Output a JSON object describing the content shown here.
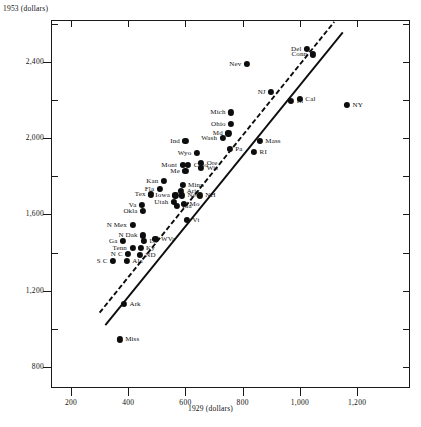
{
  "figure": {
    "faint_title": "",
    "ylabel": "1953 (dollars)",
    "xlabel": "1929 (dollars)"
  },
  "chart_data": {
    "type": "scatter",
    "title": "",
    "xlabel": "1929 (dollars)",
    "ylabel": "1953 (dollars)",
    "xlim": [
      130,
      1385
    ],
    "ylim": [
      690,
      2620
    ],
    "xticks": [
      200,
      400,
      600,
      800,
      1000,
      1200
    ],
    "xticklabels": [
      "200",
      "400",
      "600",
      "800",
      "1,000",
      "1,200"
    ],
    "yticks": [
      800,
      1200,
      1600,
      2000,
      2400
    ],
    "yticklabels": [
      "800",
      "1,200",
      "1,600",
      "2,000",
      "2,400"
    ],
    "minor_ticks": true,
    "grid": false,
    "legend": null,
    "points": [
      {
        "label": "Del",
        "x": 1025,
        "y": 2470,
        "lpos": "left"
      },
      {
        "label": "Conn",
        "x": 1045,
        "y": 2440,
        "lpos": "left"
      },
      {
        "label": "Nev",
        "x": 815,
        "y": 2390,
        "lpos": "left"
      },
      {
        "label": "NJ",
        "x": 900,
        "y": 2245,
        "lpos": "left"
      },
      {
        "label": "Ill",
        "x": 970,
        "y": 2195,
        "lpos": "right"
      },
      {
        "label": "Cal",
        "x": 1000,
        "y": 2205,
        "lpos": "right"
      },
      {
        "label": "NY",
        "x": 1165,
        "y": 2175,
        "lpos": "right"
      },
      {
        "label": "Mich",
        "x": 760,
        "y": 2135,
        "lpos": "left"
      },
      {
        "label": "Ohio",
        "x": 760,
        "y": 2075,
        "lpos": "left"
      },
      {
        "label": "Md",
        "x": 750,
        "y": 2025,
        "lpos": "left"
      },
      {
        "label": "Wash",
        "x": 730,
        "y": 2000,
        "lpos": "left"
      },
      {
        "label": "Ind",
        "x": 600,
        "y": 1985,
        "lpos": "left"
      },
      {
        "label": "Mass",
        "x": 860,
        "y": 1985,
        "lpos": "right"
      },
      {
        "label": "Pa",
        "x": 755,
        "y": 1945,
        "lpos": "right"
      },
      {
        "label": "RI",
        "x": 840,
        "y": 1930,
        "lpos": "right"
      },
      {
        "label": "Wyo",
        "x": 640,
        "y": 1925,
        "lpos": "left"
      },
      {
        "label": "Ore",
        "x": 655,
        "y": 1870,
        "lpos": "right"
      },
      {
        "label": "Colo",
        "x": 610,
        "y": 1860,
        "lpos": "right"
      },
      {
        "label": "Mont",
        "x": 590,
        "y": 1860,
        "lpos": "left"
      },
      {
        "label": "Wis",
        "x": 655,
        "y": 1845,
        "lpos": "right"
      },
      {
        "label": "Me",
        "x": 600,
        "y": 1830,
        "lpos": "left"
      },
      {
        "label": "Kan",
        "x": 525,
        "y": 1775,
        "lpos": "left"
      },
      {
        "label": "Minn",
        "x": 590,
        "y": 1755,
        "lpos": "right"
      },
      {
        "label": "Fla",
        "x": 510,
        "y": 1735,
        "lpos": "left"
      },
      {
        "label": "Ariz",
        "x": 585,
        "y": 1725,
        "lpos": "right"
      },
      {
        "label": "Tex",
        "x": 480,
        "y": 1705,
        "lpos": "left"
      },
      {
        "label": "Iowa",
        "x": 565,
        "y": 1700,
        "lpos": "left"
      },
      {
        "label": "Neb",
        "x": 588,
        "y": 1700,
        "lpos": "right"
      },
      {
        "label": "NH",
        "x": 650,
        "y": 1700,
        "lpos": "right"
      },
      {
        "label": "Utah",
        "x": 560,
        "y": 1665,
        "lpos": "left"
      },
      {
        "label": "Mo",
        "x": 595,
        "y": 1655,
        "lpos": "right"
      },
      {
        "label": "Ida",
        "x": 570,
        "y": 1645,
        "lpos": "right"
      },
      {
        "label": "Va",
        "x": 448,
        "y": 1650,
        "lpos": "left"
      },
      {
        "label": "Okla",
        "x": 452,
        "y": 1620,
        "lpos": "left"
      },
      {
        "label": "Vt",
        "x": 605,
        "y": 1570,
        "lpos": "right"
      },
      {
        "label": "N Mex",
        "x": 415,
        "y": 1545,
        "lpos": "left"
      },
      {
        "label": "N Dak",
        "x": 452,
        "y": 1490,
        "lpos": "left"
      },
      {
        "label": "WVa",
        "x": 495,
        "y": 1470,
        "lpos": "right"
      },
      {
        "label": "La",
        "x": 455,
        "y": 1462,
        "lpos": "right"
      },
      {
        "label": "Ga",
        "x": 382,
        "y": 1460,
        "lpos": "left"
      },
      {
        "label": "Ky",
        "x": 443,
        "y": 1425,
        "lpos": "right"
      },
      {
        "label": "Tenn",
        "x": 415,
        "y": 1425,
        "lpos": "left"
      },
      {
        "label": "N C",
        "x": 400,
        "y": 1392,
        "lpos": "left"
      },
      {
        "label": "ND",
        "x": 440,
        "y": 1390,
        "lpos": "right"
      },
      {
        "label": "S C",
        "x": 347,
        "y": 1355,
        "lpos": "left"
      },
      {
        "label": "Ala",
        "x": 395,
        "y": 1355,
        "lpos": "right"
      },
      {
        "label": "Ark",
        "x": 385,
        "y": 1130,
        "lpos": "right"
      },
      {
        "label": "Miss",
        "x": 370,
        "y": 945,
        "lpos": "right"
      }
    ],
    "fit_lines": [
      {
        "name": "dashed-regression-line",
        "style": "dashed",
        "x0": 300,
        "y0": 1085,
        "x1": 1120,
        "y1": 2610
      },
      {
        "name": "solid-regression-line",
        "style": "solid",
        "x0": 320,
        "y0": 1020,
        "x1": 1150,
        "y1": 2555
      }
    ]
  }
}
